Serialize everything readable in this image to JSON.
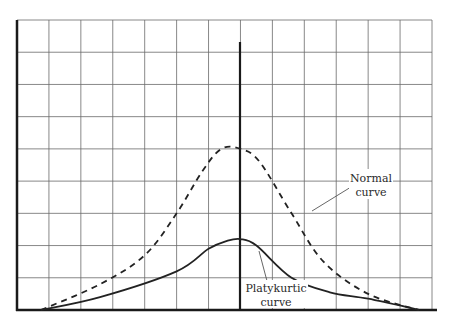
{
  "chart_data": {
    "type": "line",
    "title": "",
    "xlabel": "",
    "ylabel": "",
    "grid": true,
    "grid_cells": {
      "columns": 13,
      "rows": 9
    },
    "x_range": [
      0,
      13
    ],
    "y_range": [
      0,
      9
    ],
    "center_x": 7,
    "series": [
      {
        "name": "Normal curve",
        "style": "dashed",
        "points": [
          [
            0.75,
            0
          ],
          [
            2.6,
            0.8
          ],
          [
            4.0,
            1.7
          ],
          [
            5.0,
            3.0
          ],
          [
            5.8,
            4.3
          ],
          [
            6.4,
            5.0
          ],
          [
            7.0,
            5.0
          ],
          [
            7.6,
            4.6
          ],
          [
            8.6,
            3.0
          ],
          [
            9.6,
            1.5
          ],
          [
            11.0,
            0.5
          ],
          [
            12.6,
            0
          ]
        ]
      },
      {
        "name": "Platykurtic curve",
        "style": "solid",
        "points": [
          [
            0.75,
            0
          ],
          [
            2.6,
            0.4
          ],
          [
            5.0,
            1.2
          ],
          [
            6.0,
            1.9
          ],
          [
            6.6,
            2.15
          ],
          [
            7.0,
            2.2
          ],
          [
            7.5,
            2.0
          ],
          [
            8.6,
            1.0
          ],
          [
            9.8,
            0.55
          ],
          [
            11.0,
            0.35
          ],
          [
            12.6,
            0
          ]
        ]
      }
    ],
    "annotations": [
      {
        "text_lines": [
          "Normal",
          "curve"
        ],
        "points_to": "Normal curve"
      },
      {
        "text_lines": [
          "Platykurtic",
          "curve"
        ],
        "points_to": "Platykurtic curve"
      }
    ]
  },
  "labels": {
    "normal_line1": "Normal",
    "normal_line2": "curve",
    "platy_line1": "Platykurtic",
    "platy_line2": "curve"
  },
  "colors": {
    "grid": "#6a6a6a",
    "axis": "#1a1a1a",
    "curve": "#222222"
  }
}
